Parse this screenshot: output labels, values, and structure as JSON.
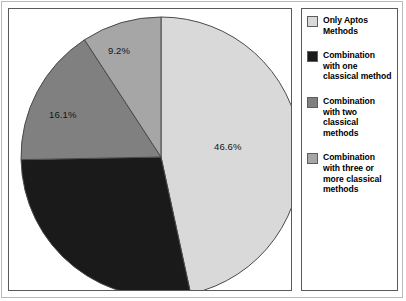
{
  "chart_data": {
    "type": "pie",
    "title": "",
    "categories": [
      "Only Aptos Methods",
      "Combination with one classical method",
      "Combination with two classical methods",
      "Combination with three or more classical methods"
    ],
    "values": [
      46.6,
      28.1,
      16.1,
      9.2
    ],
    "value_unit": "%",
    "labels_shown": [
      "46.6%",
      "",
      "16.1%",
      "9.2%"
    ],
    "colors": [
      "#d9d9d9",
      "#1a1a1a",
      "#808080",
      "#a6a6a6"
    ],
    "start_angle_deg": 0,
    "direction": "clockwise",
    "legend_position": "right",
    "grid": false,
    "xlabel": "",
    "ylabel": ""
  },
  "slice_labels": {
    "only_aptos": "46.6%",
    "two_classical": "16.1%",
    "three_or_more_classical": "9.2%"
  },
  "legend": {
    "items": [
      {
        "label": "Only Aptos Methods",
        "color": "#d9d9d9",
        "swatch_name": "legend-swatch-only-aptos"
      },
      {
        "label": "Combination with one classical method",
        "color": "#1a1a1a",
        "swatch_name": "legend-swatch-one-classical"
      },
      {
        "label": "Combination with two classical methods",
        "color": "#808080",
        "swatch_name": "legend-swatch-two-classical"
      },
      {
        "label": "Combination with three or more classical methods",
        "color": "#a6a6a6",
        "swatch_name": "legend-swatch-three-or-more-classical"
      }
    ]
  }
}
